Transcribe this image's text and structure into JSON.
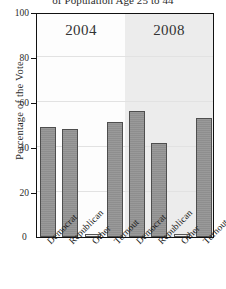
{
  "chart_data": {
    "type": "bar",
    "title": "of Population Age 25 to 44",
    "xlabel": "",
    "ylabel": "Percentage of the Vote",
    "ylim": [
      0,
      100
    ],
    "yticks": [
      0,
      20,
      40,
      60,
      80,
      100
    ],
    "grid": true,
    "legend": "none",
    "groups": [
      "2004",
      "2008"
    ],
    "categories": [
      "Democrat",
      "Republican",
      "Other",
      "Turnout"
    ],
    "series": [
      {
        "name": "2004",
        "values": [
          49,
          48,
          1,
          51
        ]
      },
      {
        "name": "2008",
        "values": [
          56,
          42,
          1,
          53
        ]
      }
    ],
    "bars": [
      {
        "group": "2004",
        "category": "Democrat",
        "value": 49,
        "fill": "dark"
      },
      {
        "group": "2004",
        "category": "Republican",
        "value": 48,
        "fill": "dark"
      },
      {
        "group": "2004",
        "category": "Other",
        "value": 1,
        "fill": "light"
      },
      {
        "group": "2004",
        "category": "Turnout",
        "value": 51,
        "fill": "dark"
      },
      {
        "group": "2008",
        "category": "Democrat",
        "value": 56,
        "fill": "dark"
      },
      {
        "group": "2008",
        "category": "Republican",
        "value": 42,
        "fill": "dark"
      },
      {
        "group": "2008",
        "category": "Other",
        "value": 1,
        "fill": "light"
      },
      {
        "group": "2008",
        "category": "Turnout",
        "value": 53,
        "fill": "dark"
      }
    ],
    "colors": {
      "bar_fill": "#8e8e8e",
      "bar_edge": "#4e4e4e",
      "bar_fill_light": "#efefef",
      "panel_2004": "#fdfdfd",
      "panel_2008": "#ececec",
      "gridline": "#e2e2e2",
      "axis": "#111111"
    },
    "zero_label": "0"
  }
}
